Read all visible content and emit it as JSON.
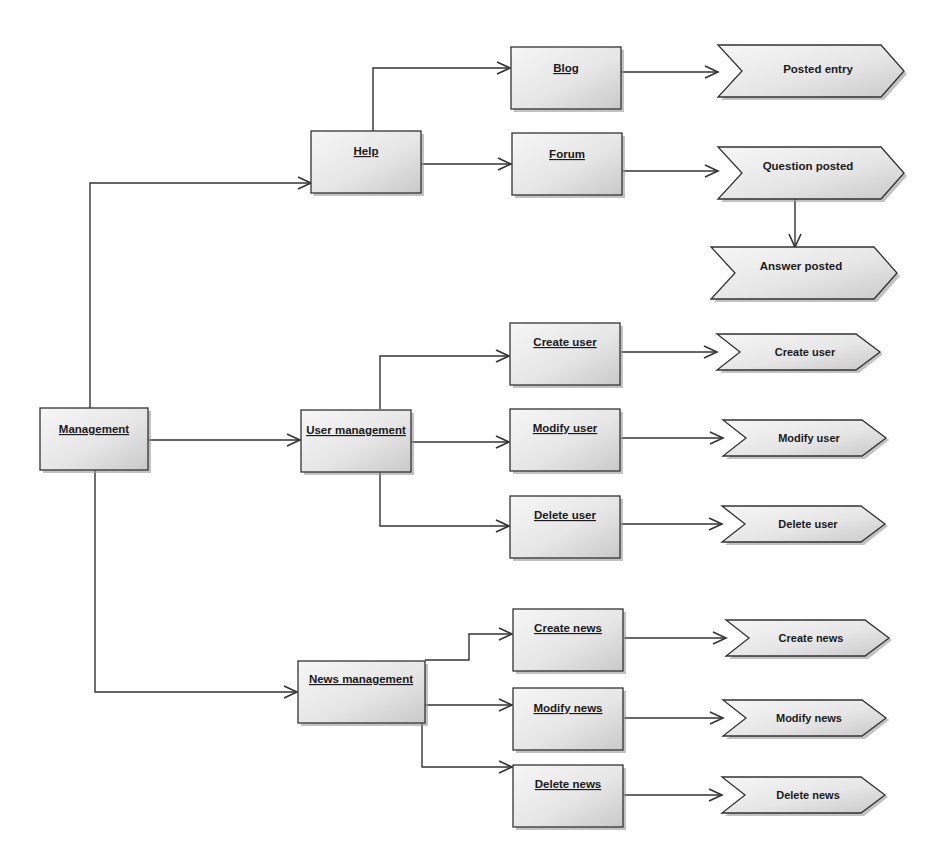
{
  "diagram": {
    "type": "process-flow",
    "colors": {
      "box_fill_light": "#f4f4f4",
      "box_fill_dark": "#cfcfcf",
      "stroke": "#333333",
      "shadow": "#9a9a9a",
      "text": "#1a1a1a"
    },
    "nodes": {
      "management": {
        "label": "Management",
        "kind": "activity"
      },
      "help": {
        "label": "Help",
        "kind": "activity"
      },
      "blog": {
        "label": "Blog",
        "kind": "activity"
      },
      "forum": {
        "label": "Forum",
        "kind": "activity"
      },
      "posted_entry": {
        "label": "Posted entry",
        "kind": "event"
      },
      "question_posted": {
        "label": "Question posted",
        "kind": "event"
      },
      "answer_posted": {
        "label": "Answer posted",
        "kind": "event"
      },
      "user_management": {
        "label": "User management",
        "kind": "activity"
      },
      "create_user": {
        "label": "Create user",
        "kind": "activity"
      },
      "modify_user": {
        "label": "Modify user",
        "kind": "activity"
      },
      "delete_user": {
        "label": "Delete user",
        "kind": "activity"
      },
      "create_user_event": {
        "label": "Create user",
        "kind": "event"
      },
      "modify_user_event": {
        "label": "Modify user",
        "kind": "event"
      },
      "delete_user_event": {
        "label": "Delete user",
        "kind": "event"
      },
      "news_management": {
        "label": "News management",
        "kind": "activity"
      },
      "create_news": {
        "label": "Create news",
        "kind": "activity"
      },
      "modify_news": {
        "label": "Modify news",
        "kind": "activity"
      },
      "delete_news": {
        "label": "Delete news",
        "kind": "activity"
      },
      "create_news_event": {
        "label": "Create news",
        "kind": "event"
      },
      "modify_news_event": {
        "label": "Modify news",
        "kind": "event"
      },
      "delete_news_event": {
        "label": "Delete news",
        "kind": "event"
      }
    },
    "edges": [
      {
        "from": "management",
        "to": "help"
      },
      {
        "from": "management",
        "to": "user_management"
      },
      {
        "from": "management",
        "to": "news_management"
      },
      {
        "from": "help",
        "to": "blog"
      },
      {
        "from": "help",
        "to": "forum"
      },
      {
        "from": "blog",
        "to": "posted_entry"
      },
      {
        "from": "forum",
        "to": "question_posted"
      },
      {
        "from": "question_posted",
        "to": "answer_posted"
      },
      {
        "from": "user_management",
        "to": "create_user"
      },
      {
        "from": "user_management",
        "to": "modify_user"
      },
      {
        "from": "user_management",
        "to": "delete_user"
      },
      {
        "from": "create_user",
        "to": "create_user_event"
      },
      {
        "from": "modify_user",
        "to": "modify_user_event"
      },
      {
        "from": "delete_user",
        "to": "delete_user_event"
      },
      {
        "from": "news_management",
        "to": "create_news"
      },
      {
        "from": "news_management",
        "to": "modify_news"
      },
      {
        "from": "news_management",
        "to": "delete_news"
      },
      {
        "from": "create_news",
        "to": "create_news_event"
      },
      {
        "from": "modify_news",
        "to": "modify_news_event"
      },
      {
        "from": "delete_news",
        "to": "delete_news_event"
      }
    ]
  }
}
